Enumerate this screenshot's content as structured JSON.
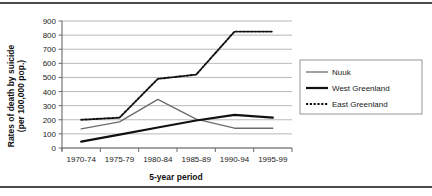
{
  "figure": {
    "name": "suicide-rates-greenland-line-chart"
  },
  "axes": {
    "y_title_line1": "Rates of death by suicide",
    "y_title_line2": "(per 100,000 pop.)",
    "x_title": "5-year period"
  },
  "legend": {
    "position": "right",
    "entries": [
      {
        "label": "Nuuk",
        "color": "#6b6b6b",
        "style": "solid-thin"
      },
      {
        "label": "West Greenland",
        "color": "#111111",
        "style": "solid-thick"
      },
      {
        "label": "East Greenland",
        "color": "#111111",
        "style": "dotted"
      }
    ]
  },
  "chart_data": {
    "type": "line",
    "title": "",
    "xlabel": "5-year period",
    "ylabel": "Rates of death by suicide (per 100,000 pop.)",
    "categories": [
      "1970-74",
      "1975-79",
      "1980-84",
      "1985-89",
      "1990-94",
      "1995-99"
    ],
    "yticks": [
      0,
      100,
      200,
      300,
      400,
      500,
      600,
      700,
      800,
      900
    ],
    "ylim": [
      0,
      900
    ],
    "grid": true,
    "series": [
      {
        "name": "Nuuk",
        "values": [
          135,
          185,
          345,
          205,
          140,
          140
        ]
      },
      {
        "name": "West Greenland",
        "values": [
          45,
          95,
          145,
          195,
          235,
          215
        ]
      },
      {
        "name": "East Greenland",
        "values": [
          200,
          215,
          490,
          520,
          825,
          825
        ]
      }
    ]
  }
}
